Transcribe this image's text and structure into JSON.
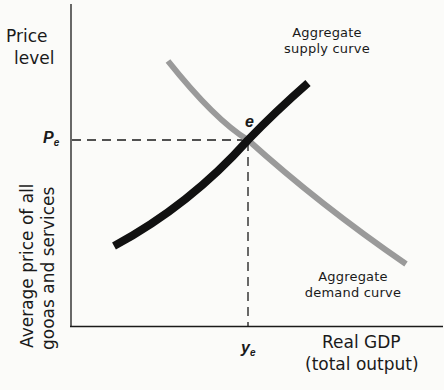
{
  "diagram": {
    "type": "aggregate supply and demand equilibrium",
    "y_axis": {
      "title_line1": "Price",
      "title_line2": "level",
      "description_line1": "Average price of all",
      "description_line2": "gooas and services"
    },
    "x_axis": {
      "title_line1": "Real GDP",
      "title_line2": "(total output)"
    },
    "curves": [
      {
        "id": "supply",
        "label_line1": "Aggregate",
        "label_line2": "supply curve",
        "color": "#111111",
        "slope": "upward"
      },
      {
        "id": "demand",
        "label_line1": "Aggregate",
        "label_line2": "demand curve",
        "color": "#9a9a9a",
        "slope": "downward"
      }
    ],
    "equilibrium": {
      "point_label": "e",
      "price_label": "P",
      "price_subscript": "e",
      "output_label": "y",
      "output_subscript": "e"
    },
    "colors": {
      "background": "#fbfbf9",
      "ink": "#111111",
      "demand_gray": "#9a9a9a"
    }
  }
}
